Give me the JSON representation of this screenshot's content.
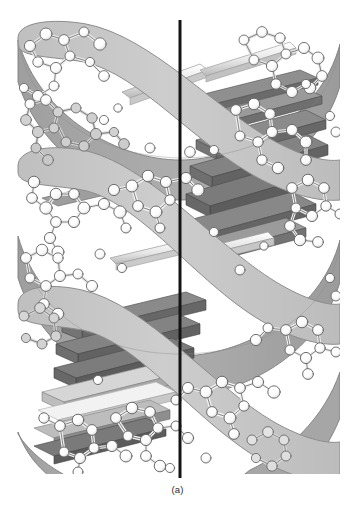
{
  "figure": {
    "caption": "(a)",
    "panel_label": "(a)",
    "background_color": "#ffffff",
    "axis_line": {
      "label": "helical-axis",
      "color": "#1a1a1a",
      "x": 180,
      "y_top": 20,
      "y_bottom": 478,
      "width_px": 3
    },
    "palette": {
      "ribbon_front": "#c9c9c9",
      "ribbon_front_edge": "#8d8d8d",
      "ribbon_back": "#a8a8a8",
      "ribbon_back_edge": "#7a7a7a",
      "base_slab_dark": "#6f6f6f",
      "base_slab_mid": "#9a9a9a",
      "base_slab_light": "#d7d7d7",
      "base_slab_white": "#f5f5f5",
      "atom_fill": "#ffffff",
      "atom_stroke": "#606060",
      "bond_fill": "#eaeaea",
      "bond_stroke": "#6a6a6a",
      "caption_color": "#2b2b2b"
    },
    "structure": {
      "helix_turns": 2.4,
      "backbone_strands": 2,
      "rise_per_turn_px": 196,
      "helix_radius_px": 152,
      "center_x": 180,
      "top_y": 20,
      "bottom_y": 472,
      "base_pair_count": 23,
      "description": "Two antiparallel sugar-phosphate backbone ribbons wound as a right-handed double helix, with flat base-pair slabs stacked between them and a ball-and-stick atomic model overlaid on the ribbons."
    },
    "backbone_ribbons": [
      {
        "name": "strand-1",
        "phase_deg": 0,
        "shade": "front"
      },
      {
        "name": "strand-2",
        "phase_deg": 180,
        "shade": "back"
      }
    ],
    "base_pair_slabs": [
      {
        "index": 1,
        "y": 62,
        "tone": "light"
      },
      {
        "index": 2,
        "y": 76,
        "tone": "light"
      },
      {
        "index": 3,
        "y": 90,
        "tone": "white"
      },
      {
        "index": 4,
        "y": 105,
        "tone": "mid"
      },
      {
        "index": 5,
        "y": 120,
        "tone": "dark"
      },
      {
        "index": 6,
        "y": 135,
        "tone": "mid"
      },
      {
        "index": 7,
        "y": 150,
        "tone": "dark"
      },
      {
        "index": 8,
        "y": 166,
        "tone": "dark"
      },
      {
        "index": 9,
        "y": 182,
        "tone": "dark"
      },
      {
        "index": 10,
        "y": 198,
        "tone": "dark"
      },
      {
        "index": 11,
        "y": 214,
        "tone": "mid"
      },
      {
        "index": 12,
        "y": 230,
        "tone": "dark"
      },
      {
        "index": 13,
        "y": 250,
        "tone": "white"
      },
      {
        "index": 14,
        "y": 268,
        "tone": "white"
      },
      {
        "index": 15,
        "y": 288,
        "tone": "light"
      },
      {
        "index": 16,
        "y": 306,
        "tone": "mid"
      },
      {
        "index": 17,
        "y": 322,
        "tone": "dark"
      },
      {
        "index": 18,
        "y": 338,
        "tone": "dark"
      },
      {
        "index": 19,
        "y": 354,
        "tone": "dark"
      },
      {
        "index": 20,
        "y": 370,
        "tone": "light"
      },
      {
        "index": 21,
        "y": 384,
        "tone": "light"
      },
      {
        "index": 22,
        "y": 398,
        "tone": "white"
      },
      {
        "index": 23,
        "y": 412,
        "tone": "mid"
      }
    ],
    "grooves": [
      {
        "name": "major-groove-upper",
        "y_center": 96,
        "side": "left"
      },
      {
        "name": "minor-groove-upper",
        "y_center": 185,
        "side": "right"
      },
      {
        "name": "major-groove-lower",
        "y_center": 288,
        "side": "center"
      },
      {
        "name": "minor-groove-lower",
        "y_center": 392,
        "side": "left"
      }
    ]
  }
}
